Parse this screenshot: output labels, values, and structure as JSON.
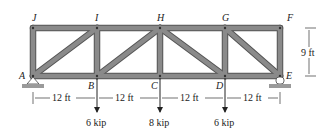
{
  "diagram": {
    "type": "truss",
    "joints": {
      "A": {
        "label": "A"
      },
      "B": {
        "label": "B"
      },
      "C": {
        "label": "C"
      },
      "D": {
        "label": "D"
      },
      "E": {
        "label": "E"
      },
      "F": {
        "label": "F"
      },
      "G": {
        "label": "G"
      },
      "H": {
        "label": "H"
      },
      "I": {
        "label": "I"
      },
      "J": {
        "label": "J"
      }
    },
    "members": [
      [
        "A",
        "B"
      ],
      [
        "B",
        "C"
      ],
      [
        "C",
        "D"
      ],
      [
        "D",
        "E"
      ],
      [
        "J",
        "I"
      ],
      [
        "I",
        "H"
      ],
      [
        "H",
        "G"
      ],
      [
        "G",
        "F"
      ],
      [
        "A",
        "J"
      ],
      [
        "B",
        "I"
      ],
      [
        "C",
        "H"
      ],
      [
        "D",
        "G"
      ],
      [
        "E",
        "F"
      ],
      [
        "A",
        "I"
      ],
      [
        "B",
        "H"
      ],
      [
        "H",
        "D"
      ],
      [
        "G",
        "E"
      ]
    ],
    "dimensions": {
      "span1": "12 ft",
      "span2": "12 ft",
      "span3": "12 ft",
      "span4": "12 ft",
      "height": "9 ft"
    },
    "loads": {
      "B": "6 kip",
      "C": "8 kip",
      "D": "6 kip"
    },
    "colors": {
      "member_fill": "#8a8a8a",
      "member_edge": "#555555",
      "ground": "#9a9a9a"
    }
  }
}
